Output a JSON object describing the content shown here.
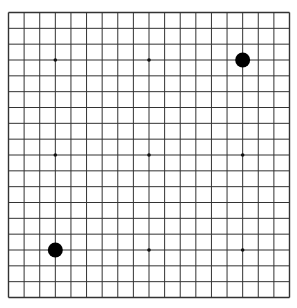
{
  "board": {
    "size": 19,
    "background": "#ffffff",
    "line_color": "#333333",
    "star_points": [
      [
        3,
        3
      ],
      [
        9,
        3
      ],
      [
        15,
        3
      ],
      [
        3,
        9
      ],
      [
        9,
        9
      ],
      [
        15,
        9
      ],
      [
        3,
        15
      ],
      [
        9,
        15
      ],
      [
        15,
        15
      ]
    ],
    "stones": [
      {
        "color": "black",
        "col": 15,
        "row": 3
      },
      {
        "color": "black",
        "col": 3,
        "row": 15
      }
    ]
  }
}
